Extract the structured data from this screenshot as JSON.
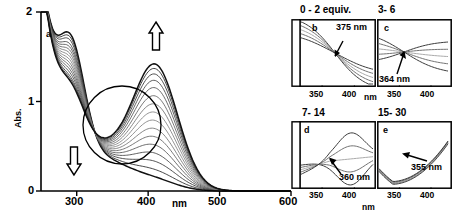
{
  "figure": {
    "kind": "uv-vis-absorption-titration-spectra",
    "background": "#ffffff",
    "line_color_light": "#7a7a7a",
    "line_color_dark": "#111111"
  },
  "main_panel": {
    "letter": "a",
    "ylabel": "Abs.",
    "xlabel": "nm",
    "x_ticks": [
      "300",
      "400",
      "500",
      "600"
    ],
    "x_tick_values": [
      300,
      400,
      500,
      600
    ],
    "y_ticks": [
      "0",
      "1",
      "2"
    ],
    "y_tick_values": [
      0,
      1,
      2
    ],
    "xlim": [
      250,
      600
    ],
    "ylim": [
      0,
      2
    ],
    "up_arrow": "increasing-band-arrow",
    "down_arrow": "decreasing-band-arrow",
    "isosbestic_circle": "isosbestic-point-circle"
  },
  "insets": [
    {
      "id": "b",
      "letter": "b",
      "heading": "0 - 2 equiv.",
      "annotation": "375 nm",
      "x_ticks": [
        "350",
        "400"
      ],
      "x_tick_values": [
        350,
        400
      ],
      "xlabel": "nm",
      "xlim": [
        330,
        425
      ]
    },
    {
      "id": "c",
      "letter": "c",
      "heading": "3- 6",
      "annotation": "364 nm",
      "x_ticks": [
        "350",
        "400"
      ],
      "x_tick_values": [
        350,
        400
      ],
      "xlabel": "nm",
      "xlim": [
        330,
        425
      ]
    },
    {
      "id": "d",
      "letter": "d",
      "heading": "7- 14",
      "annotation": "360 nm",
      "x_ticks": [
        "350",
        "400"
      ],
      "x_tick_values": [
        350,
        400
      ],
      "xlabel": "nm",
      "xlim": [
        330,
        425
      ]
    },
    {
      "id": "e",
      "letter": "e",
      "heading": "15- 30",
      "annotation": "355 nm",
      "x_ticks": [
        "350",
        "400"
      ],
      "x_tick_values": [
        350,
        400
      ],
      "xlabel": "nm",
      "xlim": [
        330,
        425
      ]
    }
  ],
  "chart_data": {
    "type": "line",
    "title": "",
    "xlabel": "nm",
    "ylabel": "Abs.",
    "xlim": [
      250,
      600
    ],
    "ylim": [
      0,
      2
    ],
    "grid": false,
    "legend": null,
    "annotations": [
      {
        "text": "a",
        "kind": "panel-letter"
      },
      {
        "text": "375 nm",
        "kind": "isosbestic-point",
        "panel": "b"
      },
      {
        "text": "364 nm",
        "kind": "isosbestic-point",
        "panel": "c"
      },
      {
        "text": "360 nm",
        "kind": "isosbestic-point",
        "panel": "d"
      },
      {
        "text": "355 nm",
        "kind": "isosbestic-point",
        "panel": "e"
      }
    ],
    "series": [
      {
        "name": "0 equiv",
        "peak295": 1.46,
        "peak410": 0.09,
        "trough330": 0.62
      },
      {
        "name": "2 equiv",
        "peak295": 1.42,
        "peak410": 0.17,
        "trough330": 0.63
      },
      {
        "name": "4 equiv",
        "peak295": 1.38,
        "peak410": 0.26,
        "trough330": 0.64
      },
      {
        "name": "6 equiv",
        "peak295": 1.33,
        "peak410": 0.35,
        "trough330": 0.65
      },
      {
        "name": "8 equiv",
        "peak295": 1.29,
        "peak410": 0.44,
        "trough330": 0.66
      },
      {
        "name": "10 equiv",
        "peak295": 1.25,
        "peak410": 0.53,
        "trough330": 0.67
      },
      {
        "name": "12 equiv",
        "peak295": 1.21,
        "peak410": 0.62,
        "trough330": 0.68
      },
      {
        "name": "14 equiv",
        "peak295": 1.17,
        "peak410": 0.71,
        "trough330": 0.69
      },
      {
        "name": "16 equiv",
        "peak295": 1.13,
        "peak410": 0.8,
        "trough330": 0.7
      },
      {
        "name": "18 equiv",
        "peak295": 1.09,
        "peak410": 0.89,
        "trough330": 0.71
      },
      {
        "name": "20 equiv",
        "peak295": 1.05,
        "peak410": 0.98,
        "trough330": 0.72
      },
      {
        "name": "22 equiv",
        "peak295": 1.01,
        "peak410": 1.07,
        "trough330": 0.73
      },
      {
        "name": "24 equiv",
        "peak295": 0.97,
        "peak410": 1.15,
        "trough330": 0.74
      },
      {
        "name": "26 equiv",
        "peak295": 0.93,
        "peak410": 1.22,
        "trough330": 0.75
      },
      {
        "name": "28 equiv",
        "peak295": 0.9,
        "peak410": 1.28,
        "trough330": 0.76
      },
      {
        "name": "30 equiv",
        "peak295": 0.87,
        "peak410": 1.33,
        "trough330": 0.77
      }
    ]
  }
}
